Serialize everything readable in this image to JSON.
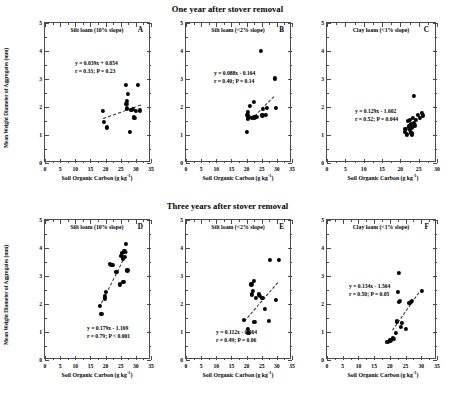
{
  "figure": {
    "y_axis_label": "Mean Weight Diameter of Aggregates (mm)",
    "x_axis_label": "Soil Organic Carbon (g kg",
    "x_axis_label_sup": "-1",
    "x_axis_label_end": ")"
  },
  "rows": [
    {
      "title": "One year after stover removal"
    },
    {
      "title": "Three years after stover removal"
    }
  ],
  "chart_data": [
    {
      "type": "scatter",
      "panel": "A",
      "title": "Silt loam (10% slope)",
      "row_title": "One year after stover removal",
      "xlabel": "Soil Organic Carbon (g kg-1)",
      "ylabel": "Mean Weight Diameter of Aggregates (mm)",
      "xlim": [
        0,
        35
      ],
      "ylim": [
        0,
        5
      ],
      "xticks": [
        0,
        5,
        10,
        15,
        20,
        25,
        30,
        35
      ],
      "yticks": [
        0,
        1,
        2,
        3,
        4,
        5
      ],
      "grid": false,
      "equation": "y = 0.039x + 0.854",
      "stats": "r = 0.33; P = 0.23",
      "slope": 0.039,
      "intercept": 0.854,
      "r": 0.33,
      "p": 0.23,
      "fit_line": {
        "x1": 19.0,
        "y1": 1.6,
        "x2": 31.5,
        "y2": 2.08
      },
      "points": [
        [
          19.1,
          1.85
        ],
        [
          19.4,
          1.47
        ],
        [
          20.4,
          1.27
        ],
        [
          26.6,
          2.78
        ],
        [
          26.9,
          2.1
        ],
        [
          27.0,
          2.22
        ],
        [
          27.1,
          1.95
        ],
        [
          27.3,
          2.48
        ],
        [
          28.0,
          1.1
        ],
        [
          28.5,
          1.9
        ],
        [
          28.9,
          1.93
        ],
        [
          29.3,
          1.66
        ],
        [
          29.5,
          1.62
        ],
        [
          30.0,
          1.87
        ],
        [
          30.6,
          2.78
        ],
        [
          31.4,
          1.88
        ]
      ]
    },
    {
      "type": "scatter",
      "panel": "B",
      "title": "Silt loam (<2% slope)",
      "row_title": "One year after stover removal",
      "xlabel": "Soil Organic Carbon (g kg-1)",
      "ylabel": "Mean Weight Diameter of Aggregates (mm)",
      "xlim": [
        0,
        35
      ],
      "ylim": [
        0,
        5
      ],
      "xticks": [
        0,
        5,
        10,
        15,
        20,
        25,
        30,
        35
      ],
      "yticks": [
        0,
        1,
        2,
        3,
        4,
        5
      ],
      "grid": false,
      "equation": "y = 0.088x - 0.164",
      "stats": "r = 0.40; P = 0.14",
      "slope": 0.088,
      "intercept": -0.164,
      "r": 0.4,
      "p": 0.14,
      "fit_line": {
        "x1": 21.5,
        "y1": 1.56,
        "x2": 29.0,
        "y2": 2.38
      },
      "points": [
        [
          20.2,
          1.12
        ],
        [
          20.3,
          1.72
        ],
        [
          20.4,
          1.58
        ],
        [
          20.5,
          1.82
        ],
        [
          20.6,
          1.65
        ],
        [
          21.2,
          2.04
        ],
        [
          21.8,
          1.62
        ],
        [
          22.3,
          2.18
        ],
        [
          22.6,
          1.63
        ],
        [
          23.4,
          1.66
        ],
        [
          24.8,
          4.01
        ],
        [
          25.2,
          1.7
        ],
        [
          25.5,
          1.92
        ],
        [
          26.4,
          1.73
        ],
        [
          26.8,
          1.97
        ],
        [
          29.3,
          3.02
        ],
        [
          29.6,
          1.96
        ]
      ]
    },
    {
      "type": "scatter",
      "panel": "C",
      "title": "Clay loam (<1% slope)",
      "row_title": "One year after stover removal",
      "xlabel": "Soil Organic Carbon (g kg-1)",
      "ylabel": "Mean Weight Diameter of Aggregates (mm)",
      "xlim": [
        0,
        30
      ],
      "ylim": [
        0,
        5
      ],
      "xticks": [
        0,
        5,
        10,
        15,
        20,
        25,
        30
      ],
      "yticks": [
        0,
        1,
        2,
        3,
        4,
        5
      ],
      "grid": false,
      "equation": "y = 0.129x - 1.602",
      "stats": "r = 0.52; P = 0.044",
      "slope": 0.129,
      "intercept": -1.602,
      "r": 0.52,
      "p": 0.044,
      "fit_line": null,
      "points": [
        [
          21.2,
          1.1
        ],
        [
          21.4,
          1.22
        ],
        [
          21.8,
          1.02
        ],
        [
          22.1,
          1.5
        ],
        [
          22.3,
          1.31
        ],
        [
          22.5,
          1.18
        ],
        [
          22.6,
          1.55
        ],
        [
          22.8,
          1.4
        ],
        [
          23.0,
          1.08
        ],
        [
          23.1,
          1.27
        ],
        [
          23.2,
          1.02
        ],
        [
          23.4,
          1.62
        ],
        [
          23.6,
          1.44
        ],
        [
          23.8,
          2.4
        ],
        [
          24.0,
          1.34
        ],
        [
          24.3,
          1.55
        ],
        [
          24.8,
          1.72
        ],
        [
          25.4,
          1.6
        ],
        [
          25.8,
          1.78
        ],
        [
          26.2,
          1.7
        ]
      ]
    },
    {
      "type": "scatter",
      "panel": "D",
      "title": "Silt loam (10% slope)",
      "row_title": "Three years after stover removal",
      "xlabel": "Soil Organic Carbon (g kg-1)",
      "ylabel": "Mean Weight Diameter of Aggregates (mm)",
      "xlim": [
        0,
        35
      ],
      "ylim": [
        0,
        5
      ],
      "xticks": [
        0,
        5,
        10,
        15,
        20,
        25,
        30,
        35
      ],
      "yticks": [
        0,
        1,
        2,
        3,
        4,
        5
      ],
      "grid": false,
      "equation": "y = 0.179x - 1.169",
      "stats": "r = 0.79; P < 0.001",
      "slope": 0.179,
      "intercept": -1.169,
      "r": 0.79,
      "p": 0.001,
      "fit_line": {
        "x1": 18.6,
        "y1": 2.05,
        "x2": 27.2,
        "y2": 3.9
      },
      "points": [
        [
          18.2,
          1.94
        ],
        [
          18.6,
          1.65
        ],
        [
          19.8,
          2.28
        ],
        [
          19.9,
          2.2
        ],
        [
          20.0,
          2.42
        ],
        [
          21.4,
          3.42
        ],
        [
          21.9,
          3.41
        ],
        [
          22.3,
          3.4
        ],
        [
          23.6,
          3.16
        ],
        [
          24.6,
          2.7
        ],
        [
          25.2,
          3.72
        ],
        [
          25.4,
          3.82
        ],
        [
          25.6,
          3.6
        ],
        [
          25.9,
          2.78
        ],
        [
          26.2,
          3.88
        ],
        [
          26.4,
          3.68
        ],
        [
          26.6,
          4.14
        ],
        [
          27.2,
          3.2
        ]
      ]
    },
    {
      "type": "scatter",
      "panel": "E",
      "title": "Silt loam (<2% slope)",
      "row_title": "Three years after stover removal",
      "xlabel": "Soil Organic Carbon (g kg-1)",
      "ylabel": "Mean Weight Diameter of Aggregates (mm)",
      "xlim": [
        0,
        35
      ],
      "ylim": [
        0,
        5
      ],
      "xticks": [
        0,
        5,
        10,
        15,
        20,
        25,
        30,
        35
      ],
      "yticks": [
        0,
        1,
        2,
        3,
        4,
        5
      ],
      "grid": false,
      "equation": "y = 0.112x - 0.564",
      "stats": "r = 0.49; P = 0.06",
      "slope": 0.112,
      "intercept": -0.564,
      "r": 0.49,
      "p": 0.06,
      "fit_line": {
        "x1": 19.0,
        "y1": 1.4,
        "x2": 30.0,
        "y2": 2.78
      },
      "points": [
        [
          19.0,
          1.42
        ],
        [
          20.4,
          1.12
        ],
        [
          20.6,
          0.96
        ],
        [
          21.6,
          2.7
        ],
        [
          21.8,
          2.34
        ],
        [
          22.0,
          2.46
        ],
        [
          22.3,
          2.82
        ],
        [
          22.6,
          1.36
        ],
        [
          23.2,
          2.22
        ],
        [
          24.0,
          2.34
        ],
        [
          24.4,
          2.3
        ],
        [
          25.2,
          2.22
        ],
        [
          26.0,
          1.83
        ],
        [
          27.4,
          1.4
        ],
        [
          27.8,
          3.58
        ],
        [
          29.8,
          2.14
        ],
        [
          30.8,
          3.58
        ]
      ]
    },
    {
      "type": "scatter",
      "panel": "F",
      "title": "Clay loam (<1% slope)",
      "row_title": "Three years after stover removal",
      "xlabel": "Soil Organic Carbon (g kg-1)",
      "ylabel": "Mean Weight Diameter of Aggregates (mm)",
      "xlim": [
        0,
        35
      ],
      "ylim": [
        0,
        5
      ],
      "xticks": [
        0,
        5,
        10,
        15,
        20,
        25,
        30,
        35
      ],
      "yticks": [
        0,
        1,
        2,
        3,
        4,
        5
      ],
      "grid": false,
      "equation": "y = 0.134x - 1.564",
      "stats": "r = 0.50; P = 0.05",
      "slope": 0.134,
      "intercept": -1.564,
      "r": 0.5,
      "p": 0.05,
      "fit_line": {
        "x1": 20.6,
        "y1": 1.06,
        "x2": 29.0,
        "y2": 2.4
      },
      "points": [
        [
          19.2,
          0.64
        ],
        [
          20.2,
          0.7
        ],
        [
          21.0,
          0.78
        ],
        [
          21.4,
          0.76
        ],
        [
          21.8,
          0.98
        ],
        [
          22.2,
          1.38
        ],
        [
          22.6,
          2.44
        ],
        [
          22.8,
          3.1
        ],
        [
          23.0,
          2.08
        ],
        [
          23.2,
          2.1
        ],
        [
          23.4,
          1.18
        ],
        [
          23.8,
          1.32
        ],
        [
          25.0,
          1.12
        ],
        [
          26.2,
          2.04
        ],
        [
          26.6,
          2.08
        ],
        [
          27.0,
          2.1
        ],
        [
          30.2,
          2.46
        ]
      ]
    }
  ]
}
